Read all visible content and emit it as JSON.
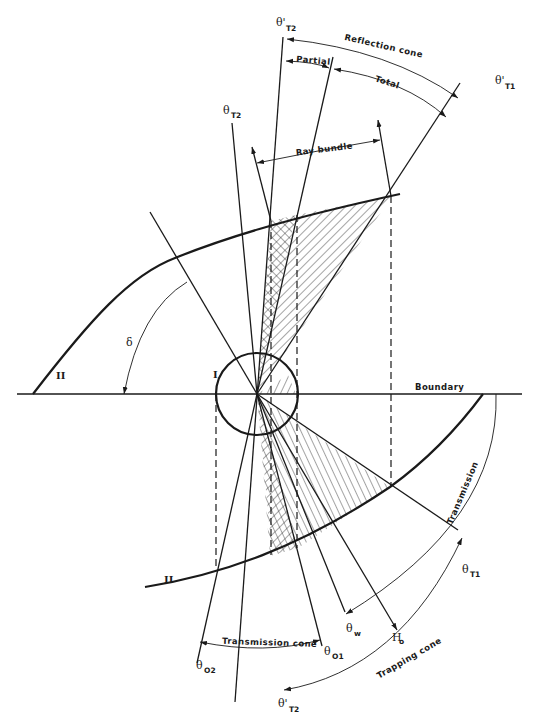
{
  "figure": {
    "labels": {
      "reflection_cone": "Reflection cone",
      "partial": "Partial",
      "total": "Total",
      "ray_bundle": "Ray bundle",
      "boundary": "Boundary",
      "transmission": "Transmission",
      "transmission_cone": "Transmission cone",
      "trapping_cone": "Trapping cone",
      "delta": "δ",
      "region_I": "I",
      "region_II_upper": "II",
      "region_II_lower": "II"
    },
    "angles": {
      "theta_T2_prime_top": {
        "sym": "θ'",
        "sub": "T2"
      },
      "theta_T1_prime": {
        "sym": "θ'",
        "sub": "T1"
      },
      "theta_T2_upper": {
        "sym": "θ",
        "sub": "T2"
      },
      "theta_T1": {
        "sym": "θ",
        "sub": "T1"
      },
      "theta_w": {
        "sym": "θ",
        "sub": "w"
      },
      "H_o": {
        "sym": "H",
        "sub": "o"
      },
      "theta_O1": {
        "sym": "θ",
        "sub": "O1"
      },
      "theta_O2": {
        "sym": "θ",
        "sub": "O2"
      },
      "theta_T2_prime_bottom": {
        "sym": "θ'",
        "sub": "T2"
      }
    }
  }
}
